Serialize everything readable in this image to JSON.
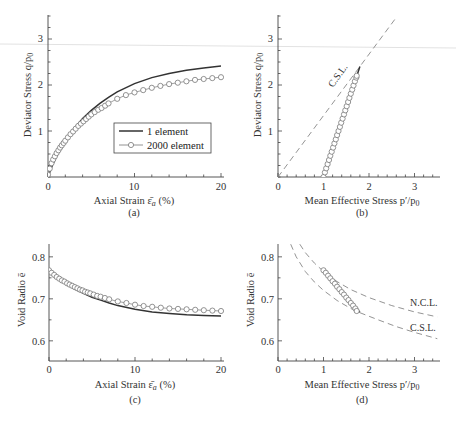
{
  "chart_data": [
    {
      "id": "a",
      "type": "line",
      "caption": "(a)",
      "xlabel": "Axial Strain ε̄a (%)",
      "ylabel": "Deviator Stress q/p0",
      "xlim": [
        0,
        20
      ],
      "ylim": [
        0,
        3.5
      ],
      "xticks": [
        0,
        10,
        20
      ],
      "yticks": [
        1,
        2,
        3
      ],
      "grid": false,
      "legend": {
        "position": "center-right",
        "entries": [
          "1 element",
          "2000 element"
        ]
      },
      "series": [
        {
          "name": "1 element",
          "style": "solid",
          "x": [
            0,
            0.5,
            1,
            2,
            3,
            4,
            5,
            6,
            7,
            8,
            10,
            12,
            14,
            16,
            18,
            20
          ],
          "y": [
            0,
            0.25,
            0.45,
            0.8,
            1.05,
            1.27,
            1.45,
            1.6,
            1.73,
            1.85,
            2.03,
            2.16,
            2.25,
            2.32,
            2.37,
            2.41
          ]
        },
        {
          "name": "2000 element",
          "style": "markers-circle",
          "x": [
            0,
            0.2,
            0.4,
            0.6,
            0.8,
            1.0,
            1.2,
            1.4,
            1.6,
            1.8,
            2.0,
            2.3,
            2.6,
            2.9,
            3.2,
            3.5,
            3.8,
            4.1,
            4.4,
            4.7,
            5.0,
            5.4,
            5.8,
            6.2,
            6.6,
            7.0,
            8.0,
            9.0,
            10.0,
            11.0,
            12.0,
            13.0,
            14.0,
            15.0,
            16.0,
            17.0,
            18.0,
            19.0,
            20.0
          ],
          "y": [
            0.05,
            0.18,
            0.3,
            0.38,
            0.45,
            0.52,
            0.58,
            0.64,
            0.69,
            0.74,
            0.79,
            0.86,
            0.93,
            0.99,
            1.05,
            1.11,
            1.16,
            1.21,
            1.26,
            1.31,
            1.36,
            1.41,
            1.46,
            1.5,
            1.55,
            1.6,
            1.7,
            1.78,
            1.84,
            1.89,
            1.94,
            1.98,
            2.02,
            2.05,
            2.08,
            2.11,
            2.13,
            2.15,
            2.17
          ]
        }
      ]
    },
    {
      "id": "b",
      "type": "line",
      "caption": "(b)",
      "xlabel": "Mean Effective Stress p′/p0",
      "ylabel": "Deviator Stress q/p0",
      "xlim": [
        0,
        3.5
      ],
      "ylim": [
        0,
        3.5
      ],
      "xticks": [
        0,
        1,
        2,
        3
      ],
      "yticks": [
        1,
        2,
        3
      ],
      "grid": false,
      "annotations": [
        {
          "text": "C.S.L.",
          "x": 1.45,
          "y": 2.05
        }
      ],
      "series": [
        {
          "name": "C.S.L.",
          "style": "dashed",
          "x": [
            0,
            2.6
          ],
          "y": [
            0,
            3.47
          ]
        },
        {
          "name": "1 element",
          "style": "solid",
          "x": [
            1.0,
            1.8
          ],
          "y": [
            0,
            2.4
          ]
        },
        {
          "name": "2000 element",
          "style": "markers-circle",
          "x": [
            1.0,
            1.03,
            1.06,
            1.09,
            1.12,
            1.15,
            1.18,
            1.21,
            1.24,
            1.27,
            1.3,
            1.33,
            1.36,
            1.39,
            1.42,
            1.45,
            1.48,
            1.51,
            1.54,
            1.57,
            1.6,
            1.63,
            1.66,
            1.69,
            1.72,
            1.73
          ],
          "y": [
            0,
            0.1,
            0.19,
            0.28,
            0.37,
            0.46,
            0.55,
            0.64,
            0.73,
            0.82,
            0.91,
            1.0,
            1.09,
            1.18,
            1.27,
            1.36,
            1.45,
            1.54,
            1.63,
            1.72,
            1.81,
            1.9,
            1.99,
            2.08,
            2.16,
            2.2
          ]
        }
      ]
    },
    {
      "id": "c",
      "type": "line",
      "caption": "(c)",
      "xlabel": "Axial Strain ε̄a (%)",
      "ylabel": "Void Radio ē",
      "xlim": [
        0,
        20
      ],
      "ylim": [
        0.552,
        0.83
      ],
      "xticks": [
        0,
        10,
        20
      ],
      "yticks": [
        0.6,
        0.7,
        0.8
      ],
      "grid": false,
      "series": [
        {
          "name": "1 element",
          "style": "solid",
          "x": [
            0,
            1,
            2,
            3,
            4,
            5,
            6,
            7,
            8,
            10,
            12,
            14,
            16,
            18,
            20
          ],
          "y": [
            0.765,
            0.748,
            0.735,
            0.723,
            0.713,
            0.704,
            0.697,
            0.69,
            0.684,
            0.675,
            0.669,
            0.665,
            0.662,
            0.66,
            0.659
          ]
        },
        {
          "name": "2000 element",
          "style": "markers-circle",
          "x": [
            0,
            0.3,
            0.6,
            0.9,
            1.2,
            1.5,
            1.8,
            2.1,
            2.4,
            2.7,
            3.0,
            3.3,
            3.6,
            3.9,
            4.2,
            4.5,
            4.8,
            5.2,
            5.6,
            6.0,
            6.5,
            7.0,
            8.0,
            9.0,
            10.0,
            11.0,
            12.0,
            13.0,
            14.0,
            15.0,
            16.0,
            17.0,
            18.0,
            19.0,
            20.0
          ],
          "y": [
            0.768,
            0.762,
            0.757,
            0.752,
            0.748,
            0.744,
            0.741,
            0.737,
            0.734,
            0.731,
            0.728,
            0.725,
            0.722,
            0.72,
            0.717,
            0.715,
            0.713,
            0.71,
            0.707,
            0.705,
            0.702,
            0.699,
            0.694,
            0.69,
            0.686,
            0.683,
            0.681,
            0.679,
            0.677,
            0.676,
            0.675,
            0.674,
            0.673,
            0.672,
            0.671
          ]
        }
      ]
    },
    {
      "id": "d",
      "type": "line",
      "caption": "(d)",
      "xlabel": "Mean Effective Stress p′/p0",
      "ylabel": "Void Radio ē",
      "xlim": [
        0,
        3.5
      ],
      "ylim": [
        0.552,
        0.83
      ],
      "xticks": [
        0,
        1,
        2,
        3
      ],
      "yticks": [
        0.6,
        0.7,
        0.8
      ],
      "grid": false,
      "annotations": [
        {
          "text": "N.C.L.",
          "x": 2.85,
          "y": 0.69
        },
        {
          "text": "C.S.L.",
          "x": 2.85,
          "y": 0.634
        }
      ],
      "series": [
        {
          "name": "N.C.L.",
          "style": "dashed",
          "x": [
            0.48,
            0.6,
            0.8,
            1.0,
            1.3,
            1.6,
            2.0,
            2.5,
            3.0,
            3.5
          ],
          "y": [
            0.83,
            0.81,
            0.785,
            0.765,
            0.741,
            0.722,
            0.703,
            0.684,
            0.669,
            0.657
          ]
        },
        {
          "name": "C.S.L. (lower)",
          "style": "dashed",
          "x": [
            0.28,
            0.4,
            0.6,
            0.8,
            1.0,
            1.3,
            1.6,
            1.8,
            2.2,
            2.6,
            3.0,
            3.5
          ],
          "y": [
            0.83,
            0.8,
            0.765,
            0.74,
            0.72,
            0.696,
            0.677,
            0.667,
            0.65,
            0.634,
            0.62,
            0.605
          ]
        },
        {
          "name": "1 element",
          "style": "solid",
          "x": [
            1.0,
            1.8
          ],
          "y": [
            0.765,
            0.668
          ]
        },
        {
          "name": "2000 element",
          "style": "markers-circle",
          "x": [
            1.0,
            1.05,
            1.1,
            1.15,
            1.2,
            1.25,
            1.3,
            1.35,
            1.4,
            1.45,
            1.5,
            1.55,
            1.6,
            1.65,
            1.7,
            1.73
          ],
          "y": [
            0.768,
            0.762,
            0.755,
            0.749,
            0.742,
            0.736,
            0.729,
            0.723,
            0.716,
            0.71,
            0.703,
            0.697,
            0.69,
            0.684,
            0.677,
            0.671
          ]
        }
      ]
    }
  ],
  "panels": {
    "a": {
      "caption": "(a)",
      "xlabel_main": "Axial Strain ",
      "xlabel_sym": "ε̄",
      "xlabel_sub": "a",
      "xlabel_tail": " (%)",
      "ylabel": "Deviator Stress q/p",
      "ylabel_sub": "0",
      "xticks": [
        "0",
        "10",
        "20"
      ],
      "yticks": [
        "1",
        "2",
        "3"
      ],
      "legend": [
        "1 element",
        "2000 element"
      ]
    },
    "b": {
      "caption": "(b)",
      "xlabel": "Mean Effective Stress p′/p",
      "xlabel_sub": "0",
      "ylabel": "Deviator Stress q/p",
      "ylabel_sub": "0",
      "xticks": [
        "0",
        "1",
        "2",
        "3"
      ],
      "yticks": [
        "1",
        "2",
        "3"
      ],
      "csl_label": "C.S.L."
    },
    "c": {
      "caption": "(c)",
      "xlabel_main": "Axial Strain ",
      "xlabel_sym": "ε̄",
      "xlabel_sub": "a",
      "xlabel_tail": " (%)",
      "ylabel": "Void Radio ē",
      "xticks": [
        "0",
        "10",
        "20"
      ],
      "yticks": [
        "0.6",
        "0.7",
        "0.8"
      ]
    },
    "d": {
      "caption": "(d)",
      "xlabel": "Mean Effective Stress p′/p",
      "xlabel_sub": "0",
      "ylabel": "Void Radio ē",
      "xticks": [
        "0",
        "1",
        "2",
        "3"
      ],
      "yticks": [
        "0.6",
        "0.7",
        "0.8"
      ],
      "ncl_label": "N.C.L.",
      "csl_label": "C.S.L."
    }
  },
  "colors": {
    "axis": "#444444",
    "line": "#333333",
    "marker_edge": "#777777",
    "dashed": "#888888",
    "text": "#333333",
    "scan_line": "#dddddd"
  }
}
